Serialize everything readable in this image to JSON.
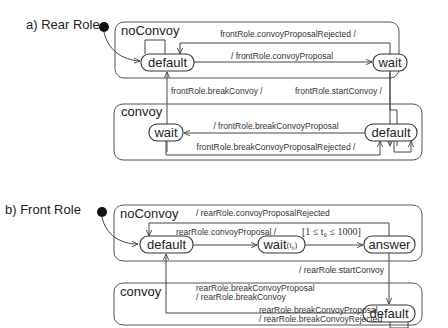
{
  "diagram": {
    "a": {
      "title": "a) Rear Role",
      "noConvoy": {
        "label": "noConvoy",
        "states": {
          "default": "default",
          "wait": "wait"
        },
        "transitions": {
          "rejected": "frontRole.convoyProposalRejected /",
          "proposal": "/ frontRole.convoyProposal"
        }
      },
      "between": {
        "breakConvoy": "frontRole.breakConvoy /",
        "startConvoy": "frontRole.startConvoy /"
      },
      "convoy": {
        "label": "convoy",
        "states": {
          "wait": "wait",
          "default": "default"
        },
        "transitions": {
          "breakProposal": "/ frontRole.breakConvoyProposal",
          "breakRejected": "frontRole.breakConvoyProposalRejected /"
        }
      }
    },
    "b": {
      "title": "b) Front Role",
      "noConvoy": {
        "label": "noConvoy",
        "states": {
          "default": "default",
          "wait": "wait",
          "wait_clock": "(t₀)",
          "answer": "answer"
        },
        "transitions": {
          "rejected": "/ rearRole.convoyProposalRejected",
          "proposal": "rearRole.convoyProposal /",
          "guard": "[1 ≤ t₀ ≤ 1000]"
        }
      },
      "between": {
        "startConvoy": "/ rearRole.startConvoy"
      },
      "convoy": {
        "label": "convoy",
        "states": {
          "default": "default"
        },
        "transitions": {
          "breakProposal_1": "rearRole.breakConvoyProposal",
          "breakProposal_2": "/ rearRole.breakConvoy",
          "selfloop_1": "rearRole.breakConvoyProposal",
          "selfloop_2": "/ rearRole.breakConvoyRejected"
        }
      }
    }
  }
}
